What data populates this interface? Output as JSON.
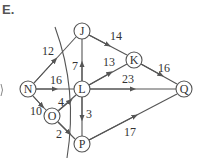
{
  "problem_label": "E.",
  "colors": {
    "stroke": "#555555",
    "text": "#333333",
    "background": "#ffffff"
  },
  "nodes": [
    {
      "id": "N",
      "label": "N",
      "x": 28,
      "y": 89
    },
    {
      "id": "J",
      "label": "J",
      "x": 82,
      "y": 31
    },
    {
      "id": "L",
      "label": "L",
      "x": 82,
      "y": 89
    },
    {
      "id": "O",
      "label": "O",
      "x": 52,
      "y": 116
    },
    {
      "id": "P",
      "label": "P",
      "x": 82,
      "y": 144
    },
    {
      "id": "K",
      "label": "K",
      "x": 134,
      "y": 60
    },
    {
      "id": "Q",
      "label": "Q",
      "x": 184,
      "y": 89
    }
  ],
  "edges": [
    {
      "from": "N",
      "to": "J",
      "weight": "12"
    },
    {
      "from": "N",
      "to": "L",
      "weight": "16"
    },
    {
      "from": "N",
      "to": "O",
      "weight": "10"
    },
    {
      "from": "O",
      "to": "L",
      "weight": "4"
    },
    {
      "from": "O",
      "to": "P",
      "weight": "2"
    },
    {
      "from": "L",
      "to": "J",
      "weight": "7"
    },
    {
      "from": "L",
      "to": "P",
      "weight": "3"
    },
    {
      "from": "J",
      "to": "K",
      "weight": "14"
    },
    {
      "from": "L",
      "to": "K",
      "weight": "13"
    },
    {
      "from": "L",
      "to": "Q",
      "weight": "23"
    },
    {
      "from": "K",
      "to": "Q",
      "weight": "16"
    },
    {
      "from": "P",
      "to": "Q",
      "weight": "17"
    }
  ],
  "cut_line": "curve crossing edges N-J, N-L, O-L, O-P"
}
